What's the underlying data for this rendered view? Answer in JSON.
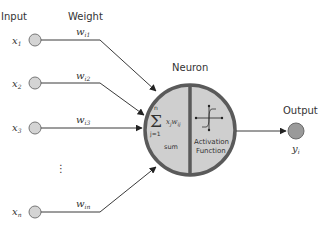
{
  "headers": {
    "input": "Input",
    "weight": "Weight",
    "neuron": "Neuron",
    "output": "Output"
  },
  "inputs": [
    {
      "var": "x",
      "sub": "1",
      "weight_var": "w",
      "weight_sub": "i1"
    },
    {
      "var": "x",
      "sub": "2",
      "weight_var": "w",
      "weight_sub": "i2"
    },
    {
      "var": "x",
      "sub": "3",
      "weight_var": "w",
      "weight_sub": "i3"
    },
    {
      "var": "x",
      "sub": "n",
      "weight_var": "w",
      "weight_sub": "in"
    }
  ],
  "ellipsis": "⋮",
  "neuron": {
    "sum_symbol": "Σ",
    "sum_upper": "n",
    "sum_lower": "j=1",
    "sum_term": "x",
    "sum_term_sub": "j",
    "sum_term_w": "w",
    "sum_term_w_sub": "ij",
    "sum_label": "sum",
    "activation_line1": "Activation",
    "activation_line2": "Function"
  },
  "output": {
    "var": "y",
    "sub": "i"
  },
  "colors": {
    "node_fill": "#d4d4d4",
    "neuron_fill": "#cfcfcf",
    "neuron_border": "#5a5a5a",
    "output_fill": "#9a9a9a",
    "line": "#3a3a3a"
  }
}
